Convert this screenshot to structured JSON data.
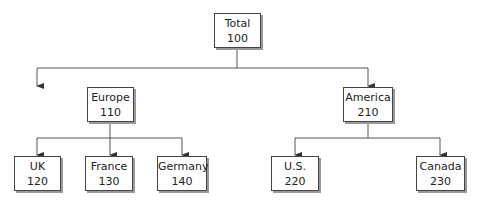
{
  "diagram": {
    "type": "tree",
    "root": {
      "label": "Total",
      "value": "100"
    },
    "regions": [
      {
        "label": "Europe",
        "value": "110"
      },
      {
        "label": "America",
        "value": "210"
      }
    ],
    "countries": [
      {
        "label": "UK",
        "value": "120",
        "parent": "Europe"
      },
      {
        "label": "France",
        "value": "130",
        "parent": "Europe"
      },
      {
        "label": "Germany",
        "value": "140",
        "parent": "Europe"
      },
      {
        "label": "U.S.",
        "value": "220",
        "parent": "America"
      },
      {
        "label": "Canada",
        "value": "230",
        "parent": "America"
      }
    ]
  }
}
